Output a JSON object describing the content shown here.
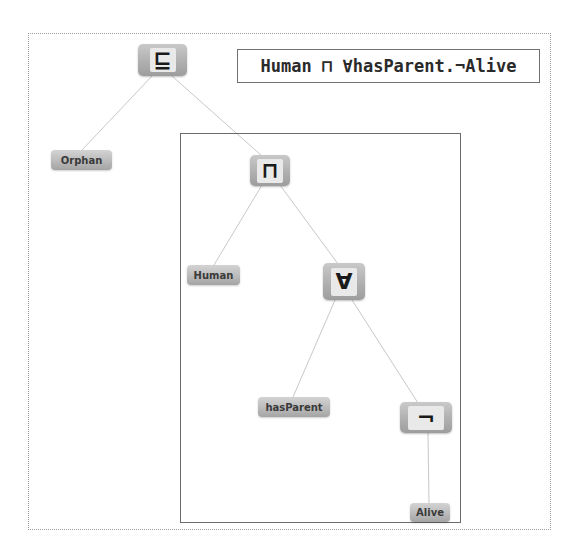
{
  "diagram": {
    "formula": "Human ⊓ ∀hasParent.¬Alive",
    "colors": {
      "node_fill_top": "#c9c9c9",
      "node_fill_bottom": "#9d9d9d",
      "edge": "#c8c8c8",
      "scope_border": "#6b6b6b",
      "frame_border": "#9a9a9a"
    },
    "nodes": {
      "subsumes": {
        "symbol": "⊑",
        "name": "subsumption"
      },
      "intersection": {
        "symbol": "⊓",
        "name": "intersection"
      },
      "forall": {
        "symbol": "∀",
        "name": "universal-restriction"
      },
      "negation": {
        "symbol": "¬",
        "name": "negation"
      },
      "orphan": {
        "label": "Orphan"
      },
      "human": {
        "label": "Human"
      },
      "hasparent": {
        "label": "hasParent"
      },
      "alive": {
        "label": "Alive"
      }
    },
    "edges": [
      {
        "from": "⊑",
        "to": "Orphan"
      },
      {
        "from": "⊑",
        "to": "⊓"
      },
      {
        "from": "⊓",
        "to": "Human"
      },
      {
        "from": "⊓",
        "to": "∀"
      },
      {
        "from": "∀",
        "to": "hasParent"
      },
      {
        "from": "∀",
        "to": "¬"
      },
      {
        "from": "¬",
        "to": "Alive"
      }
    ]
  }
}
